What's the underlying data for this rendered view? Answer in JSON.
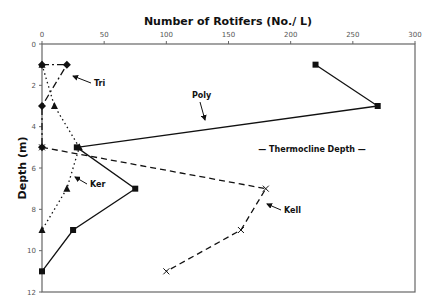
{
  "chart_data": {
    "type": "line",
    "title": "Number of Rotifers (No./ L)",
    "xlabel": "Number of Rotifers (No./ L)",
    "ylabel": "Depth (m)",
    "xlim": [
      0,
      300
    ],
    "ylim": [
      0,
      12
    ],
    "y_inverted": true,
    "x_axis_position": "top",
    "x_ticks": [
      0,
      50,
      100,
      150,
      200,
      250,
      300
    ],
    "y_ticks": [
      0,
      2,
      4,
      6,
      8,
      10,
      12
    ],
    "grid": false,
    "legend": "none (inline arrow annotations)",
    "series": [
      {
        "name": "Poly",
        "style": "solid",
        "marker": "square",
        "points": [
          [
            220,
            1
          ],
          [
            270,
            3
          ],
          [
            28,
            5
          ],
          [
            75,
            7
          ],
          [
            25,
            9
          ],
          [
            0,
            11
          ]
        ]
      },
      {
        "name": "Tri",
        "style": "dash-dot",
        "marker": "diamond",
        "points": [
          [
            0,
            1
          ],
          [
            20,
            1
          ],
          [
            0,
            3
          ],
          [
            0,
            5
          ]
        ]
      },
      {
        "name": "Ker",
        "style": "dotted",
        "marker": "triangle",
        "points": [
          [
            0,
            1
          ],
          [
            10,
            3
          ],
          [
            30,
            5
          ],
          [
            20,
            7
          ],
          [
            0,
            9
          ]
        ]
      },
      {
        "name": "Kell",
        "style": "dashed",
        "marker": "x",
        "points": [
          [
            0,
            5
          ],
          [
            180,
            7
          ],
          [
            160,
            9
          ],
          [
            100,
            11
          ]
        ]
      }
    ],
    "annotations": [
      {
        "text": "Tri",
        "x": 30,
        "y": 2
      },
      {
        "text": "Poly",
        "x": 130,
        "y": 3
      },
      {
        "text": "Ker",
        "x": 35,
        "y": 7
      },
      {
        "text": "Kell",
        "x": 200,
        "y": 8
      },
      {
        "text": "— Thermocline Depth —",
        "x": 230,
        "y": 5
      }
    ]
  },
  "labels": {
    "title": "Number of Rotifers (No./ L)",
    "ylabel": "Depth (m)",
    "thermocline": "— Thermocline Depth —",
    "tri": "Tri",
    "poly": "Poly",
    "ker": "Ker",
    "kell": "Kell"
  }
}
